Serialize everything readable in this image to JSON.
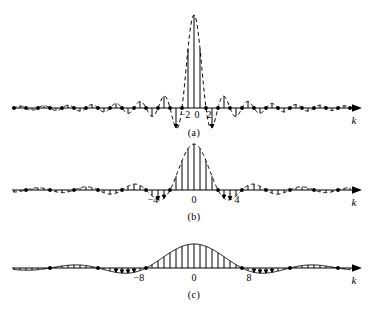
{
  "figure": {
    "background_color": "#ffffff",
    "line_color": "#000000",
    "panels": [
      {
        "caption": "(a)",
        "axis_variable": "k",
        "tick_labels": [
          "−2",
          "0",
          "2"
        ],
        "tick_values": [
          -2,
          0,
          2
        ],
        "main_lobe_halfwidth": 2,
        "peak_height": 93,
        "baseline_y": 108,
        "envelope_style": "dashed",
        "stem_count": 61
      },
      {
        "caption": "(b)",
        "axis_variable": "k",
        "tick_labels": [
          "−4",
          "0",
          "4"
        ],
        "tick_values": [
          -4,
          0,
          4
        ],
        "main_lobe_halfwidth": 4,
        "peak_height": 46,
        "baseline_y": 190,
        "envelope_style": "dashed",
        "stem_count": 61
      },
      {
        "caption": "(c)",
        "axis_variable": "k",
        "tick_labels": [
          "−8",
          "0",
          "8"
        ],
        "tick_values": [
          -8,
          0,
          8
        ],
        "main_lobe_halfwidth": 8,
        "peak_height": 24,
        "baseline_y": 268,
        "envelope_style": "solid",
        "stem_count": 61
      }
    ]
  },
  "chart_data": {
    "type": "bar",
    "title": "",
    "subtitle": "",
    "xlabel": "k",
    "ylabel": "",
    "grid": false,
    "legend": null,
    "panels": [
      {
        "name": "(a)",
        "type": "bar",
        "xlabel": "k",
        "ylabel": "",
        "xtick_labels": [
          "−2",
          "0",
          "2"
        ],
        "xtick_values": [
          -2,
          0,
          2
        ],
        "xlim": [
          -30,
          30
        ],
        "ylim": [
          -0.25,
          1.0
        ],
        "envelope": "sinc(k/2), dashed",
        "zero_crossings": [
          -30,
          -28,
          -26,
          -24,
          -22,
          -20,
          -18,
          -16,
          -14,
          -12,
          -10,
          -8,
          -6,
          -4,
          -2,
          2,
          4,
          6,
          8,
          10,
          12,
          14,
          16,
          18,
          20,
          22,
          24,
          26,
          28,
          30
        ],
        "x": [
          -30,
          -29,
          -28,
          -27,
          -26,
          -25,
          -24,
          -23,
          -22,
          -21,
          -20,
          -19,
          -18,
          -17,
          -16,
          -15,
          -14,
          -13,
          -12,
          -11,
          -10,
          -9,
          -8,
          -7,
          -6,
          -5,
          -4,
          -3,
          -2,
          -1,
          0,
          1,
          2,
          3,
          4,
          5,
          6,
          7,
          8,
          9,
          10,
          11,
          12,
          13,
          14,
          15,
          16,
          17,
          18,
          19,
          20,
          21,
          22,
          23,
          24,
          25,
          26,
          27,
          28,
          29,
          30
        ],
        "values": [
          0.0,
          0.021,
          0.0,
          -0.022,
          0.0,
          0.024,
          0.0,
          -0.026,
          0.0,
          0.029,
          0.0,
          -0.032,
          0.0,
          0.035,
          0.0,
          -0.04,
          0.0,
          0.047,
          0.0,
          -0.055,
          0.0,
          0.067,
          0.0,
          -0.086,
          0.0,
          0.12,
          0.0,
          -0.2,
          0.0,
          0.6,
          1.0,
          0.6,
          0.0,
          -0.2,
          0.0,
          0.12,
          0.0,
          -0.086,
          0.0,
          0.067,
          0.0,
          -0.055,
          0.0,
          0.047,
          0.0,
          -0.04,
          0.0,
          0.035,
          0.0,
          -0.032,
          0.0,
          0.029,
          0.0,
          -0.026,
          0.0,
          0.024,
          0.0,
          -0.022,
          0.0,
          0.021,
          0.0
        ]
      },
      {
        "name": "(b)",
        "type": "bar",
        "xlabel": "k",
        "ylabel": "",
        "xtick_labels": [
          "−4",
          "0",
          "4"
        ],
        "xtick_values": [
          -4,
          0,
          4
        ],
        "xlim": [
          -30,
          30
        ],
        "ylim": [
          -0.25,
          1.0
        ],
        "envelope": "sinc(k/4), dashed",
        "zero_crossings": [
          -28,
          -24,
          -20,
          -16,
          -12,
          -8,
          -4,
          4,
          8,
          12,
          16,
          20,
          24,
          28
        ],
        "x": [
          -30,
          -29,
          -28,
          -27,
          -26,
          -25,
          -24,
          -23,
          -22,
          -21,
          -20,
          -19,
          -18,
          -17,
          -16,
          -15,
          -14,
          -13,
          -12,
          -11,
          -10,
          -9,
          -8,
          -7,
          -6,
          -5,
          -4,
          -3,
          -2,
          -1,
          0,
          1,
          2,
          3,
          4,
          5,
          6,
          7,
          8,
          9,
          10,
          11,
          12,
          13,
          14,
          15,
          16,
          17,
          18,
          19,
          20,
          21,
          22,
          23,
          24,
          25,
          26,
          27,
          28,
          29,
          30
        ],
        "values": [
          -0.03,
          -0.022,
          0.0,
          0.023,
          0.032,
          0.023,
          0.0,
          -0.025,
          -0.036,
          -0.026,
          0.0,
          0.029,
          0.042,
          0.03,
          0.0,
          -0.035,
          -0.05,
          -0.036,
          0.0,
          0.044,
          0.064,
          0.046,
          0.0,
          -0.06,
          -0.09,
          -0.065,
          0.0,
          0.11,
          0.18,
          0.15,
          0.0,
          -0.21,
          -0.31,
          -0.23,
          0.0,
          0.3,
          0.45,
          0.33,
          0.0,
          -0.45,
          -0.64,
          -0.46,
          0.0,
          0.64,
          0.9,
          0.65,
          1.0,
          0.65,
          0.9,
          0.64,
          0.0,
          -0.46,
          -0.64,
          -0.45,
          0.0,
          0.33,
          0.45,
          0.3,
          0.0,
          -0.23,
          -0.31
        ]
      },
      {
        "name": "(c)",
        "type": "bar",
        "xlabel": "k",
        "ylabel": "",
        "xtick_labels": [
          "−8",
          "0",
          "8"
        ],
        "xtick_values": [
          -8,
          0,
          8
        ],
        "xlim": [
          -30,
          30
        ],
        "ylim": [
          -0.25,
          1.0
        ],
        "envelope": "sinc(k/8), solid",
        "zero_crossings": [
          -24,
          -16,
          -8,
          8,
          16,
          24
        ],
        "x": [
          -30,
          -29,
          -28,
          -27,
          -26,
          -25,
          -24,
          -23,
          -22,
          -21,
          -20,
          -19,
          -18,
          -17,
          -16,
          -15,
          -14,
          -13,
          -12,
          -11,
          -10,
          -9,
          -8,
          -7,
          -6,
          -5,
          -4,
          -3,
          -2,
          -1,
          0,
          1,
          2,
          3,
          4,
          5,
          6,
          7,
          8,
          9,
          10,
          11,
          12,
          13,
          14,
          15,
          16,
          17,
          18,
          19,
          20,
          21,
          22,
          23,
          24,
          25,
          26,
          27,
          28,
          29,
          30
        ],
        "values": [
          0.03,
          0.038,
          0.042,
          0.041,
          0.036,
          0.027,
          0.0,
          -0.03,
          -0.05,
          -0.062,
          -0.066,
          -0.062,
          -0.05,
          -0.03,
          0.0,
          0.045,
          0.08,
          0.105,
          0.118,
          0.118,
          0.105,
          0.07,
          0.0,
          -0.11,
          -0.23,
          -0.35,
          -0.46,
          -0.56,
          -0.65,
          -0.72,
          1.0,
          -0.72,
          -0.65,
          -0.56,
          -0.46,
          -0.35,
          -0.23,
          -0.11,
          0.0,
          0.07,
          0.105,
          0.118,
          0.118,
          0.105,
          0.08,
          0.045,
          0.0,
          -0.03,
          -0.05,
          -0.062,
          -0.066,
          -0.062,
          -0.05,
          -0.03,
          0.0,
          0.027,
          0.036,
          0.041,
          0.042,
          0.038,
          0.03
        ]
      }
    ]
  }
}
